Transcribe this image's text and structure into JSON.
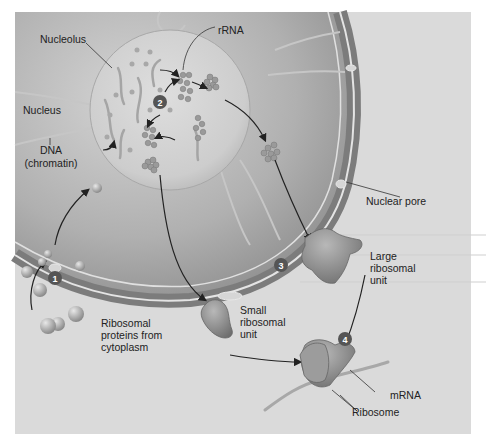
{
  "figure": {
    "colors": {
      "page_bg": "#ffffff",
      "panel_bg": "#dcdcdc",
      "cytoplasm": "#d8d8d8",
      "nucleus": "#b4b4b4",
      "nucleolus": "#d0d0d0",
      "envelope": "#8e8e8e",
      "envelope_highlight": "#e6e6e6",
      "ribosome": "#8a8a8a",
      "step_badge": "#555555",
      "text": "#222222"
    },
    "labels": {
      "nucleolus": "Nucleolus",
      "rrna": "rRNA",
      "nucleus": "Nucleus",
      "dna_line1": "DNA",
      "dna_line2": "(chromatin)",
      "nuclear_pore": "Nuclear pore",
      "large_unit_line1": "Large",
      "large_unit_line2": "ribosomal",
      "large_unit_line3": "unit",
      "small_unit_line1": "Small",
      "small_unit_line2": "ribosomal",
      "small_unit_line3": "unit",
      "proteins_line1": "Ribosomal",
      "proteins_line2": "proteins from",
      "proteins_line3": "cytoplasm",
      "mrna": "mRNA",
      "ribosome": "Ribosome"
    },
    "steps": [
      "1",
      "2",
      "3",
      "4"
    ]
  }
}
